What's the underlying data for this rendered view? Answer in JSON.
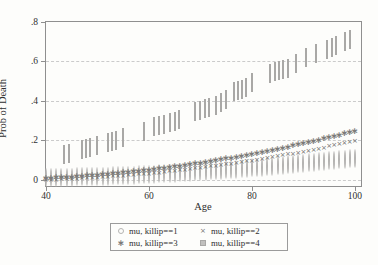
{
  "figure": {
    "background": "#fdfdfb",
    "border_color": "#8f8f8f",
    "grid_color": "#cbcbcb",
    "text_color": "#2f2f2f"
  },
  "chart_data": {
    "type": "scatter",
    "title": "",
    "xlabel": "Age",
    "ylabel": "Prob of Death",
    "xlim": [
      40,
      101.2
    ],
    "ylim": [
      -0.033,
      0.8
    ],
    "grid": "horizontal-dashed",
    "legend_position": "bottom-center",
    "x_ticks": [
      40,
      60,
      80,
      100
    ],
    "x_tick_labels": [
      "40",
      "60",
      "80",
      "100"
    ],
    "y_ticks": [
      0,
      0.2,
      0.4,
      0.6,
      0.8
    ],
    "y_tick_labels": [
      "0",
      ".2",
      ".4",
      ".6",
      ".8"
    ],
    "ages": [
      40,
      41,
      42,
      43,
      44,
      45,
      46,
      47,
      48,
      49,
      50,
      51,
      52,
      53,
      54,
      55,
      56,
      57,
      58,
      59,
      60,
      61,
      62,
      63,
      64,
      65,
      66,
      67,
      68,
      69,
      70,
      71,
      72,
      73,
      74,
      75,
      76,
      77,
      78,
      79,
      80,
      81,
      82,
      83,
      84,
      85,
      86,
      87,
      88,
      89,
      90,
      91,
      92,
      93,
      94,
      95,
      96,
      97,
      98,
      99,
      100
    ],
    "series": [
      {
        "name": "mu, killip==1",
        "marker": "circle-open",
        "color": "#b5b4b2",
        "values": [
          0.007,
          0.0074,
          0.0079,
          0.0084,
          0.0089,
          0.0095,
          0.0102,
          0.0108,
          0.0115,
          0.0123,
          0.0131,
          0.0139,
          0.0148,
          0.0157,
          0.0167,
          0.0177,
          0.0187,
          0.0198,
          0.0209,
          0.0221,
          0.0233,
          0.0245,
          0.0258,
          0.0271,
          0.0285,
          0.0299,
          0.0314,
          0.0329,
          0.0344,
          0.036,
          0.0376,
          0.0393,
          0.041,
          0.0427,
          0.0445,
          0.0464,
          0.0482,
          0.0502,
          0.0521,
          0.0541,
          0.0561,
          0.0582,
          0.0604,
          0.0625,
          0.0647,
          0.067,
          0.0693,
          0.0716,
          0.074,
          0.0764,
          0.0789,
          0.0814,
          0.084,
          0.0866,
          0.0892,
          0.0919,
          0.0947,
          0.0975,
          0.1003,
          0.1032,
          0.1061
        ]
      },
      {
        "name": "mu, killip==2",
        "marker": "x",
        "color": "#6f6e6c",
        "values": [
          0.013,
          0.0138,
          0.0148,
          0.0158,
          0.0169,
          0.018,
          0.0193,
          0.0206,
          0.0221,
          0.0236,
          0.0252,
          0.0269,
          0.0286,
          0.0305,
          0.0324,
          0.0344,
          0.0365,
          0.0387,
          0.0409,
          0.0433,
          0.0457,
          0.0482,
          0.0508,
          0.0535,
          0.0562,
          0.0591,
          0.062,
          0.065,
          0.0681,
          0.0713,
          0.0746,
          0.0779,
          0.0813,
          0.0848,
          0.0884,
          0.0921,
          0.0959,
          0.0997,
          0.1036,
          0.1076,
          0.1117,
          0.1159,
          0.1201,
          0.1244,
          0.1289,
          0.1334,
          0.1379,
          0.1426,
          0.1473,
          0.1522,
          0.1571,
          0.1621,
          0.1671,
          0.1723,
          0.1775,
          0.1829,
          0.1883,
          0.1937,
          0.1993,
          0.205,
          0.2107
        ]
      },
      {
        "name": "mu, killip==3",
        "marker": "asterisk",
        "color": "#7c7b79",
        "values": [
          0.018,
          0.0192,
          0.0206,
          0.022,
          0.0235,
          0.0252,
          0.0269,
          0.0287,
          0.0306,
          0.0326,
          0.0347,
          0.0369,
          0.0391,
          0.0415,
          0.044,
          0.0465,
          0.0492,
          0.0519,
          0.0547,
          0.0577,
          0.0607,
          0.0638,
          0.067,
          0.0703,
          0.0737,
          0.0772,
          0.0808,
          0.0844,
          0.0882,
          0.0921,
          0.096,
          0.1001,
          0.1042,
          0.1085,
          0.1128,
          0.1172,
          0.1217,
          0.1263,
          0.131,
          0.1358,
          0.1407,
          0.1457,
          0.1508,
          0.156,
          0.1612,
          0.1666,
          0.172,
          0.1776,
          0.1832,
          0.189,
          0.1948,
          0.2007,
          0.2067,
          0.2128,
          0.219,
          0.2253,
          0.2317,
          0.2382,
          0.2448,
          0.2515,
          0.2583
        ]
      },
      {
        "name": "mu, killip==4",
        "marker": "square",
        "color": "#c1c0be",
        "points": [
          [
            43.5,
            0.125
          ],
          [
            44.5,
            0.131
          ],
          [
            47,
            0.15
          ],
          [
            47.8,
            0.155
          ],
          [
            48.6,
            0.161
          ],
          [
            50,
            0.17
          ],
          [
            52,
            0.185
          ],
          [
            52.8,
            0.19
          ],
          [
            53.6,
            0.196
          ],
          [
            55,
            0.21
          ],
          [
            59,
            0.24
          ],
          [
            61,
            0.265
          ],
          [
            62,
            0.271
          ],
          [
            63,
            0.279
          ],
          [
            64,
            0.286
          ],
          [
            65,
            0.294
          ],
          [
            65.8,
            0.3
          ],
          [
            69,
            0.345
          ],
          [
            70,
            0.35
          ],
          [
            70.8,
            0.356
          ],
          [
            71.6,
            0.361
          ],
          [
            73,
            0.375
          ],
          [
            74,
            0.39
          ],
          [
            75,
            0.405
          ],
          [
            76.5,
            0.444
          ],
          [
            77.3,
            0.45
          ],
          [
            78,
            0.456
          ],
          [
            78.8,
            0.465
          ],
          [
            80,
            0.489
          ],
          [
            83.5,
            0.538
          ],
          [
            84.5,
            0.545
          ],
          [
            85.3,
            0.55
          ],
          [
            86,
            0.555
          ],
          [
            87,
            0.561
          ],
          [
            88.5,
            0.585
          ],
          [
            90.5,
            0.615
          ],
          [
            92.5,
            0.639
          ],
          [
            94.5,
            0.659
          ],
          [
            95.5,
            0.666
          ],
          [
            96.3,
            0.676
          ],
          [
            98,
            0.699
          ],
          [
            99,
            0.71
          ]
        ]
      }
    ]
  }
}
